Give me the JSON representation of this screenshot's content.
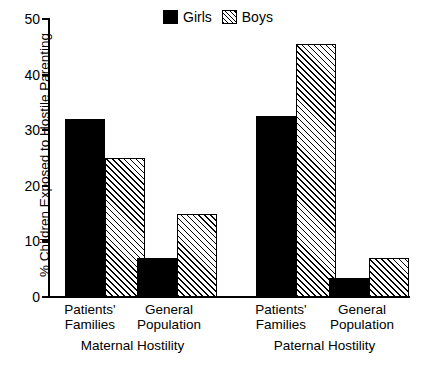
{
  "chart_data": {
    "type": "bar",
    "title": "",
    "xlabel": "",
    "ylabel": "% Children Exposed to Hostile Parenting",
    "ylim": [
      0,
      50
    ],
    "yticks": [
      0,
      10,
      20,
      30,
      40,
      50
    ],
    "grid": false,
    "legend_position": "top-center",
    "groups": [
      {
        "name": "Maternal Hostility",
        "categories": [
          "Patients' Families",
          "General Population"
        ]
      },
      {
        "name": "Paternal Hostility",
        "categories": [
          "Patients' Families",
          "General Population"
        ]
      }
    ],
    "categories": [
      "Maternal Hostility / Patients' Families",
      "Maternal Hostility / General Population",
      "Paternal Hostility / Patients' Families",
      "Paternal Hostility / General Population"
    ],
    "series": [
      {
        "name": "Girls",
        "fill": "solid",
        "color": "#000000",
        "values": [
          32.0,
          7.0,
          32.5,
          3.5
        ]
      },
      {
        "name": "Boys",
        "fill": "hatched",
        "color": "#000000",
        "values": [
          25.0,
          15.0,
          45.5,
          7.0
        ]
      }
    ]
  },
  "legend": {
    "items": [
      {
        "label": "Girls",
        "swatch": "solid-square-icon"
      },
      {
        "label": "Boys",
        "swatch": "hatched-square-icon"
      }
    ]
  },
  "axes": {
    "y_title": "% Children Exposed to Hostile Parenting",
    "y_tick_labels": [
      "0",
      "10",
      "20",
      "30",
      "40",
      "50"
    ]
  },
  "x_labels": {
    "group1": {
      "cat1_line1": "Patients'",
      "cat1_line2": "Families",
      "cat2_line1": "General",
      "cat2_line2": "Population",
      "group_name": "Maternal Hostility"
    },
    "group2": {
      "cat1_line1": "Patients'",
      "cat1_line2": "Families",
      "cat2_line1": "General",
      "cat2_line2": "Population",
      "group_name": "Paternal Hostility"
    }
  }
}
